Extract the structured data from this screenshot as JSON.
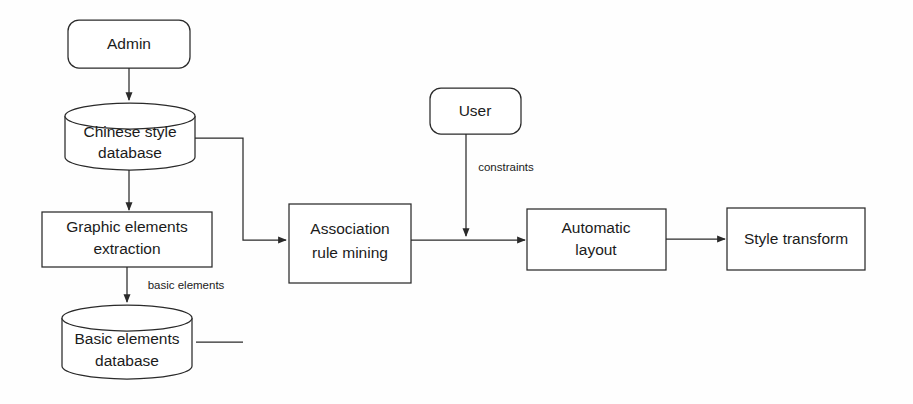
{
  "diagram": {
    "background_color": "#fefefe",
    "stroke_color": "#2a2a2a",
    "text_color": "#1b1b1b",
    "nodes": [
      {
        "id": "admin",
        "label": "Admin",
        "shape": "rounded-rect"
      },
      {
        "id": "chinese_db",
        "label_line1": "Chinese style",
        "label_line2": "database",
        "shape": "cylinder"
      },
      {
        "id": "graphic_ext",
        "label_line1": "Graphic elements",
        "label_line2": "extraction",
        "shape": "rect"
      },
      {
        "id": "basic_db",
        "label_line1": "Basic elements",
        "label_line2": "database",
        "shape": "cylinder"
      },
      {
        "id": "assoc_mining",
        "label_line1": "Association",
        "label_line2": "rule mining",
        "shape": "rect"
      },
      {
        "id": "user",
        "label": "User",
        "shape": "rounded-rect"
      },
      {
        "id": "auto_layout",
        "label_line1": "Automatic",
        "label_line2": "layout",
        "shape": "rect"
      },
      {
        "id": "style_trans",
        "label": "Style transform",
        "shape": "rect"
      }
    ],
    "edge_labels": [
      {
        "id": "basic_elements_label",
        "text": "basic elements"
      },
      {
        "id": "constraints_label",
        "text": "constraints"
      }
    ]
  }
}
